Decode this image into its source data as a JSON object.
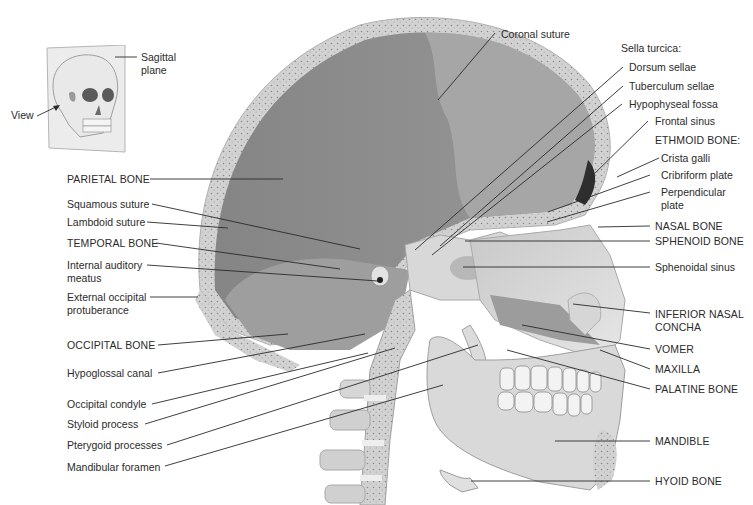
{
  "figure": {
    "colors": {
      "background": "#ffffff",
      "cranial_cavity": "#8e8e8e",
      "frontal_region": "#a9a9a9",
      "bone_light": "#dcdcdc",
      "bone_mid": "#c4c4c4",
      "diploe": "#bdbdbd",
      "leader_line": "#2a2a2a",
      "text": "#2b2b2b"
    }
  },
  "inset": {
    "plane_label_line1": "Sagittal",
    "plane_label_line2": "plane",
    "view_label": "View"
  },
  "labels_left": [
    {
      "id": "parietal-bone",
      "line1": "PARIETAL BONE",
      "line2": ""
    },
    {
      "id": "squamous-suture",
      "line1": "Squamous suture",
      "line2": ""
    },
    {
      "id": "lambdoid-suture",
      "line1": "Lambdoid suture",
      "line2": ""
    },
    {
      "id": "temporal-bone",
      "line1": "TEMPORAL BONE",
      "line2": ""
    },
    {
      "id": "internal-auditory-meatus",
      "line1": "Internal auditory",
      "line2": "meatus"
    },
    {
      "id": "external-occipital-protuberance",
      "line1": "External occipital",
      "line2": "protuberance"
    },
    {
      "id": "occipital-bone",
      "line1": "OCCIPITAL BONE",
      "line2": ""
    },
    {
      "id": "hypoglossal-canal",
      "line1": "Hypoglossal canal",
      "line2": ""
    },
    {
      "id": "occipital-condyle",
      "line1": "Occipital condyle",
      "line2": ""
    },
    {
      "id": "styloid-process",
      "line1": "Styloid process",
      "line2": ""
    },
    {
      "id": "pterygoid-processes",
      "line1": "Pterygoid processes",
      "line2": ""
    },
    {
      "id": "mandibular-foramen",
      "line1": "Mandibular foramen",
      "line2": ""
    }
  ],
  "labels_top": [
    {
      "id": "coronal-suture",
      "line1": "Coronal suture"
    }
  ],
  "labels_right": [
    {
      "id": "sella-turcica",
      "line1": "Sella turcica:",
      "line2": ""
    },
    {
      "id": "dorsum-sellae",
      "line1": "Dorsum sellae",
      "line2": ""
    },
    {
      "id": "tuberculum-sellae",
      "line1": "Tuberculum sellae",
      "line2": ""
    },
    {
      "id": "hypophyseal-fossa",
      "line1": "Hypophyseal fossa",
      "line2": ""
    },
    {
      "id": "frontal-sinus",
      "line1": "Frontal sinus",
      "line2": ""
    },
    {
      "id": "ethmoid-bone",
      "line1": "ETHMOID BONE:",
      "line2": ""
    },
    {
      "id": "crista-galli",
      "line1": "Crista galli",
      "line2": ""
    },
    {
      "id": "cribriform-plate",
      "line1": "Cribriform plate",
      "line2": ""
    },
    {
      "id": "perpendicular-plate",
      "line1": "Perpendicular",
      "line2": "plate"
    },
    {
      "id": "nasal-bone",
      "line1": "NASAL BONE",
      "line2": ""
    },
    {
      "id": "sphenoid-bone",
      "line1": "SPHENOID BONE",
      "line2": ""
    },
    {
      "id": "sphenoidal-sinus",
      "line1": "Sphenoidal sinus",
      "line2": ""
    },
    {
      "id": "inferior-nasal-concha",
      "line1": "INFERIOR NASAL",
      "line2": "CONCHA"
    },
    {
      "id": "vomer",
      "line1": "VOMER",
      "line2": ""
    },
    {
      "id": "maxilla",
      "line1": "MAXILLA",
      "line2": ""
    },
    {
      "id": "palatine-bone",
      "line1": "PALATINE BONE",
      "line2": ""
    },
    {
      "id": "mandible",
      "line1": "MANDIBLE",
      "line2": ""
    },
    {
      "id": "hyoid-bone",
      "line1": "HYOID BONE",
      "line2": ""
    }
  ]
}
